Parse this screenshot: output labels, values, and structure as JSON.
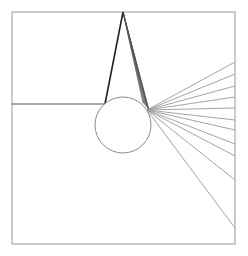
{
  "canvas": {
    "width": 248,
    "height": 256,
    "background": "#ffffff"
  },
  "frame": {
    "x": 12,
    "y": 12,
    "width": 223,
    "height": 232,
    "stroke": "#a8a8a8",
    "stroke_width": 1.2
  },
  "apex": {
    "x": 123,
    "y": 12
  },
  "circle": {
    "cx": 123,
    "cy": 125,
    "r": 28,
    "stroke": "#8c8c8c",
    "stroke_width": 1
  },
  "horizontal_line": {
    "x1": 12,
    "y1": 104,
    "x2": 105,
    "y2": 104,
    "stroke": "#555555",
    "stroke_width": 1.2
  },
  "left_tangent_line": {
    "x1": 123,
    "y1": 12,
    "x2": 105,
    "y2": 104,
    "stroke": "#222222",
    "stroke_width": 1.6
  },
  "apex_fan": {
    "stroke": "#555555",
    "stroke_width": 0.7,
    "from": {
      "x": 123,
      "y": 12
    },
    "to": [
      {
        "x": 143,
        "y": 103
      },
      {
        "x": 144,
        "y": 104
      },
      {
        "x": 145,
        "y": 105
      },
      {
        "x": 146,
        "y": 106
      },
      {
        "x": 147,
        "y": 107
      },
      {
        "x": 147.5,
        "y": 108
      },
      {
        "x": 148,
        "y": 109
      },
      {
        "x": 148.5,
        "y": 110
      },
      {
        "x": 149,
        "y": 111
      },
      {
        "x": 149.5,
        "y": 112
      }
    ]
  },
  "right_rays": {
    "stroke": "#9a9a9a",
    "stroke_width": 0.9,
    "origin": {
      "x": 147,
      "y": 110
    },
    "endpoints_x": 235,
    "endpoints_y": [
      62,
      74,
      86,
      97,
      108,
      120,
      130,
      144,
      156,
      180,
      228
    ]
  }
}
